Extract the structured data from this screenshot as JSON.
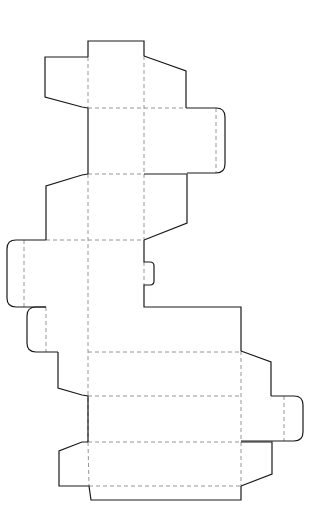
{
  "diagram": {
    "type": "box-dieline",
    "colors": {
      "cut_line": "#1a1a1a",
      "fold_line": "#8a8a8a",
      "background": "#ffffff"
    },
    "legend": {
      "solid": "cut line",
      "dashed": "fold line"
    },
    "cut_paths": [
      {
        "name": "top-tuck-tab",
        "d": "M88,57 L88,41 L144,41 L144,56"
      },
      {
        "name": "top-left-dust-flap",
        "d": "M88,57 L45,57 L45,97 L82,107 L88,108"
      },
      {
        "name": "top-right-dust-flap",
        "d": "M144,56 L186,71 L186,108"
      },
      {
        "name": "upper-right-side-panel",
        "d": "M186,108 L216,108 Q225,108 225,117 L225,164 Q225,173 216,173 L187,173"
      },
      {
        "name": "upper-left-edge",
        "d": "M88,108 L88,174"
      },
      {
        "name": "upper-right-edge",
        "d": "M187,108 L187,108"
      },
      {
        "name": "mid-left-flap",
        "d": "M88,174 L82,175 L46,186 L46,240"
      },
      {
        "name": "mid-right-flap",
        "d": "M144,174 L187,174 L187,223 L144,240"
      },
      {
        "name": "mid-upper-line-a",
        "d": "M144,108 L144,108"
      },
      {
        "name": "left-side-panel",
        "d": "M46,240 L16,240 Q7,240 7,249 L7,298 Q7,307 16,307 L46,307"
      },
      {
        "name": "right-edge-with-lock-tab",
        "d": "M144,240 L144,262 L150,262 Q154,262 154,266 L154,281 Q154,285 150,285 L144,285 L144,307 L241,307 L241,351"
      },
      {
        "name": "glue-tab",
        "d": "M46,307 L36,307 Q27,307 27,316 L27,343 Q27,352 36,352 L58,352"
      },
      {
        "name": "lower-left-flap",
        "d": "M58,352 L58,388 L82,395 L88,396 L88,442"
      },
      {
        "name": "lower-right-flap",
        "d": "M241,351 L271,362 L271,396"
      },
      {
        "name": "lower-right-side-panel",
        "d": "M271,396 L294,396 Q303,396 303,405 L303,432 Q303,441 294,441 L241,441"
      },
      {
        "name": "bottom-left-flap",
        "d": "M88,442 L82,442 L59,451 L59,486 L89,486 L91,500 L241,500 L241,486"
      },
      {
        "name": "bottom-right-flap",
        "d": "M241,442 L272,442 L272,474 L241,486"
      }
    ],
    "fold_paths": [
      {
        "name": "fold-v-left-upper",
        "d": "M88,57 L88,108"
      },
      {
        "name": "fold-v-mid-upper",
        "d": "M144,56 L144,174"
      },
      {
        "name": "fold-h-108",
        "d": "M88,108 L186,108"
      },
      {
        "name": "fold-side-right-upper",
        "d": "M216,108 L216,173"
      },
      {
        "name": "fold-h-173",
        "d": "M88,174 L144,174"
      },
      {
        "name": "fold-v-left-main",
        "d": "M88,174 L88,442"
      },
      {
        "name": "fold-v-mid-main",
        "d": "M144,174 L144,240"
      },
      {
        "name": "fold-h-240",
        "d": "M46,240 L144,240"
      },
      {
        "name": "fold-side-left",
        "d": "M24,240 L24,307"
      },
      {
        "name": "fold-lock-tab",
        "d": "M144,262 L144,285"
      },
      {
        "name": "fold-glue-tab",
        "d": "M46,307 L46,352"
      },
      {
        "name": "fold-h-352",
        "d": "M88,352 L241,352"
      },
      {
        "name": "fold-h-396",
        "d": "M88,396 L241,396"
      },
      {
        "name": "fold-v-right-lower",
        "d": "M241,351 L241,486"
      },
      {
        "name": "fold-side-right-lower",
        "d": "M284,396 L284,441"
      },
      {
        "name": "fold-h-442",
        "d": "M88,442 L241,442"
      },
      {
        "name": "fold-v-left-bottom",
        "d": "M88,442 L89,486"
      },
      {
        "name": "fold-h-486",
        "d": "M89,486 L241,486"
      }
    ]
  }
}
